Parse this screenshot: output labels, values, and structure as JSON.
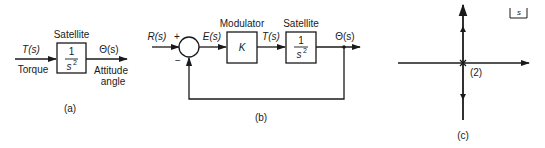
{
  "panels": {
    "a": {
      "caption": "(a)",
      "block_title": "Satellite",
      "numerator": "1",
      "denominator": "s",
      "denominator_exp": "2",
      "input_signal": "T(s)",
      "input_label": "Torque",
      "output_signal": "Θ(s)",
      "output_label_line1": "Attitude",
      "output_label_line2": "angle"
    },
    "b": {
      "caption": "(b)",
      "reference_signal": "R(s)",
      "plus_sign": "+",
      "minus_sign": "−",
      "error_signal": "E(s)",
      "modulator_title": "Modulator",
      "modulator_gain": "K",
      "torque_signal": "T(s)",
      "satellite_title": "Satellite",
      "numerator": "1",
      "denominator": "s",
      "denominator_exp": "2",
      "output_signal": "Θ(s)"
    },
    "c": {
      "caption": "(c)",
      "plane_label": "s",
      "pole_multiplicity": "(2)"
    }
  }
}
